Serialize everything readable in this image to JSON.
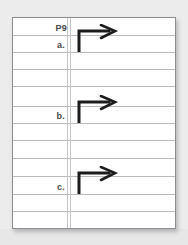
{
  "page": {
    "background_color": "#ececed",
    "paper_color": "#ffffff",
    "rule_color": "#b9bbbd",
    "margin_line_color": "#c3c5c7",
    "ink_color": "#1c1c1c",
    "border_color": "#8e8e90"
  },
  "paper": {
    "rules": [
      {
        "y": 17
      },
      {
        "y": 34
      },
      {
        "y": 51
      },
      {
        "y": 68
      },
      {
        "y": 88
      },
      {
        "y": 105
      },
      {
        "y": 122
      },
      {
        "y": 140
      },
      {
        "y": 158
      },
      {
        "y": 176
      },
      {
        "y": 193
      },
      {
        "y": 211
      }
    ],
    "margin_lines": [
      {
        "x": 54
      },
      {
        "x": 57
      }
    ]
  },
  "labels": {
    "page_number": "P9",
    "item_a": "a.",
    "item_b": "b.",
    "item_c": "c."
  },
  "arrows": [
    {
      "id": "arrow-a",
      "icon": "turn-right-arrow-icon",
      "description": "vertical stroke turning right with arrowhead"
    },
    {
      "id": "arrow-b",
      "icon": "turn-right-arrow-icon",
      "description": "vertical stroke turning right with arrowhead"
    },
    {
      "id": "arrow-c",
      "icon": "turn-right-arrow-icon",
      "description": "vertical stroke turning right with arrowhead"
    }
  ]
}
